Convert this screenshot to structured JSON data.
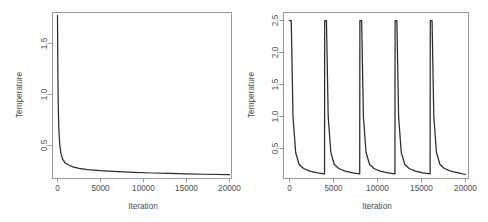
{
  "figure": {
    "background_color": "#ffffff",
    "line_color": "#2b2b2b",
    "axis_color": "#9a9a9a",
    "text_color": "#4d4d4d"
  },
  "chart_data": [
    {
      "type": "line",
      "panel": "left",
      "title": "",
      "xlabel": "Iteration",
      "ylabel": "Temperature",
      "xlim": [
        0,
        20000
      ],
      "ylim": [
        0.13,
        1.85
      ],
      "xticks": [
        0,
        5000,
        10000,
        15000,
        20000
      ],
      "xticklabels": [
        "0",
        "5000",
        "10000",
        "15000",
        "20000"
      ],
      "yticks": [
        0.5,
        1.0,
        1.5
      ],
      "yticklabels": [
        "0.5",
        "1.0",
        "1.5"
      ],
      "grid": false,
      "legend": "none",
      "description": "Monotone logarithmic cooling schedule: temperature falls steeply from ~1.8 near iteration 0 to ~0.25 by iteration 1500, then decays slowly toward ~0.16 at iteration 20000.",
      "series": [
        {
          "name": "Temperature",
          "x": [
            0,
            40,
            80,
            150,
            250,
            400,
            600,
            900,
            1300,
            1800,
            2500,
            3500,
            5000,
            7000,
            9000,
            11000,
            13000,
            15000,
            17000,
            20000
          ],
          "y": [
            1.82,
            1.25,
            0.92,
            0.66,
            0.49,
            0.39,
            0.33,
            0.29,
            0.27,
            0.25,
            0.235,
            0.223,
            0.211,
            0.2,
            0.193,
            0.187,
            0.182,
            0.178,
            0.174,
            0.17
          ]
        }
      ]
    },
    {
      "type": "line",
      "panel": "right",
      "title": "",
      "xlabel": "Iteration",
      "ylabel": "Temperature",
      "xlim": [
        0,
        20000
      ],
      "ylim": [
        0.13,
        2.62
      ],
      "xticks": [
        0,
        5000,
        10000,
        15000,
        20000
      ],
      "xticklabels": [
        "0",
        "5000",
        "10000",
        "15000",
        "20000"
      ],
      "yticks": [
        0.5,
        1.0,
        1.5,
        2.0,
        2.5
      ],
      "yticklabels": [
        "0.5",
        "1.0",
        "1.5",
        "2.0",
        "2.5"
      ],
      "grid": false,
      "legend": "none",
      "cycles": 5,
      "cycle_length": 4000,
      "peak_temperature": 2.5,
      "floor_temperature": 0.18,
      "description": "Cyclic reheating (restart) schedule: temperature is reset to 2.5 at the start of each of 5 cycles of 4000 iterations and decays rapidly to ~0.2 before the next reheat.",
      "series": [
        {
          "name": "Temperature",
          "x": [
            0,
            200,
            400,
            700,
            1100,
            1600,
            2300,
            3200,
            3980,
            4000,
            4200,
            4400,
            4700,
            5100,
            5600,
            6300,
            7200,
            7980,
            8000,
            8200,
            8400,
            8700,
            9100,
            9600,
            10300,
            11200,
            11980,
            12000,
            12200,
            12400,
            12700,
            13100,
            13600,
            14300,
            15200,
            15980,
            16000,
            16200,
            16400,
            16700,
            17100,
            17600,
            18300,
            19200,
            20000
          ],
          "y": [
            2.5,
            2.5,
            1.05,
            0.52,
            0.34,
            0.28,
            0.24,
            0.215,
            0.2,
            2.5,
            2.5,
            1.05,
            0.52,
            0.34,
            0.28,
            0.24,
            0.215,
            0.2,
            2.5,
            2.5,
            1.05,
            0.52,
            0.34,
            0.28,
            0.24,
            0.215,
            0.2,
            2.5,
            2.5,
            1.05,
            0.52,
            0.34,
            0.28,
            0.24,
            0.215,
            0.2,
            2.5,
            2.5,
            1.05,
            0.52,
            0.34,
            0.28,
            0.24,
            0.215,
            0.19
          ]
        }
      ]
    }
  ]
}
